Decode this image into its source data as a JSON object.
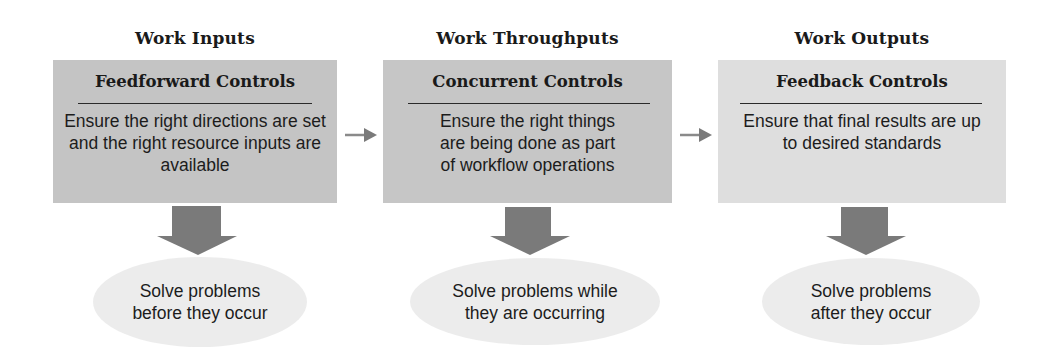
{
  "diagram": {
    "type": "control-process-flow",
    "colors": {
      "box_dark": "#c4c4c4",
      "box_light": "#dedede",
      "ellipse": "#ececec",
      "down_arrow": "#7a7a7a",
      "flow_arrow": "#8a8a8a",
      "text": "#1a1a1a"
    },
    "stages": [
      {
        "heading": "Work Inputs",
        "control_title": "Feedforward Controls",
        "description": "Ensure the right directions are set and the right resource inputs are available",
        "outcome": "Solve problems\nbefore they occur"
      },
      {
        "heading": "Work Throughputs",
        "control_title": "Concurrent Controls",
        "description": "Ensure the right things are being done as part of workflow operations",
        "outcome": "Solve problems while\nthey are occurring"
      },
      {
        "heading": "Work Outputs",
        "control_title": "Feedback Controls",
        "description": "Ensure that final results are up to desired standards",
        "outcome": "Solve problems\nafter they occur"
      }
    ],
    "flow_arrows": [
      {
        "from": "Feedforward Controls",
        "to": "Concurrent Controls",
        "icon": "right-arrow-icon"
      },
      {
        "from": "Concurrent Controls",
        "to": "Feedback Controls",
        "icon": "right-arrow-icon"
      }
    ]
  }
}
